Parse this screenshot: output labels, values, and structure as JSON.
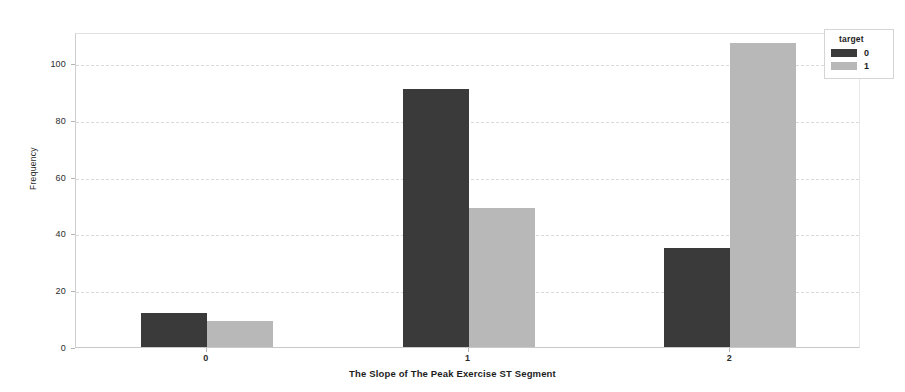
{
  "chart_data": {
    "type": "bar",
    "title": "",
    "xlabel": "The Slope of The Peak Exercise ST Segment",
    "ylabel": "Frequency",
    "categories": [
      "0",
      "1",
      "2"
    ],
    "series": [
      {
        "name": "0",
        "color": "#3a3a3a",
        "values": [
          12,
          91,
          35
        ]
      },
      {
        "name": "1",
        "color": "#b8b8b8",
        "values": [
          9,
          49,
          107
        ]
      }
    ],
    "legend": {
      "title": "target",
      "position": "upper-right",
      "entries": [
        {
          "label": "0",
          "color": "#3a3a3a"
        },
        {
          "label": "1",
          "color": "#b8b8b8"
        }
      ]
    },
    "ylim": [
      0,
      111
    ],
    "yticks": [
      0,
      20,
      40,
      60,
      80,
      100
    ],
    "ytick_labels": [
      "0",
      "20",
      "40",
      "60",
      "80",
      "100"
    ],
    "xtick_labels": [
      "0",
      "1",
      "2"
    ],
    "grid": true,
    "grid_axis": "y",
    "grid_style": "dashed",
    "background": "#ffffff"
  }
}
